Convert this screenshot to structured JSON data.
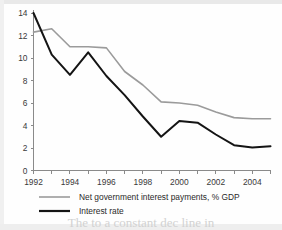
{
  "figure": {
    "background_color": "#fefefe",
    "caption_partial": "The  to  a  constant  dec  line  in"
  },
  "chart_data": {
    "type": "line",
    "title": "",
    "subtitle": "",
    "xlabel": "",
    "ylabel": "",
    "x": [
      1992,
      1993,
      1994,
      1995,
      1996,
      1997,
      1998,
      1999,
      2000,
      2001,
      2002,
      2003,
      2004,
      2005
    ],
    "xlim": [
      1992,
      2005
    ],
    "ylim": [
      0,
      14
    ],
    "yticks": [
      0,
      2,
      4,
      6,
      8,
      10,
      12,
      14
    ],
    "xticks_labeled": [
      1992,
      1994,
      1996,
      1998,
      2000,
      2002,
      2004
    ],
    "xticks_all": [
      1992,
      1993,
      1994,
      1995,
      1996,
      1997,
      1998,
      1999,
      2000,
      2001,
      2002,
      2003,
      2004,
      2005
    ],
    "grid": false,
    "legend_position": "below",
    "series": [
      {
        "name": "Net government interest payments, % GDP",
        "color": "#9b9b9b",
        "values": [
          12.3,
          12.6,
          11.0,
          11.0,
          10.9,
          8.8,
          7.6,
          6.1,
          6.0,
          5.8,
          5.2,
          4.7,
          4.6,
          4.6
        ]
      },
      {
        "name": "Interest rate",
        "color": "#141414",
        "values": [
          14.0,
          10.3,
          8.5,
          10.5,
          8.4,
          6.7,
          4.8,
          3.0,
          4.4,
          4.25,
          3.2,
          2.25,
          2.05,
          2.15
        ]
      }
    ]
  },
  "axes": {
    "y_tick_labels": [
      "0",
      "2",
      "4",
      "6",
      "8",
      "10",
      "12",
      "14"
    ],
    "x_tick_labels": [
      "1992",
      "1994",
      "1996",
      "1998",
      "2000",
      "2002",
      "2004"
    ]
  },
  "legend": {
    "entries": [
      {
        "label": "Net government interest payments, % GDP",
        "swatch": "line-gray-thin"
      },
      {
        "label": "Interest rate",
        "swatch": "line-black-thick"
      }
    ]
  }
}
